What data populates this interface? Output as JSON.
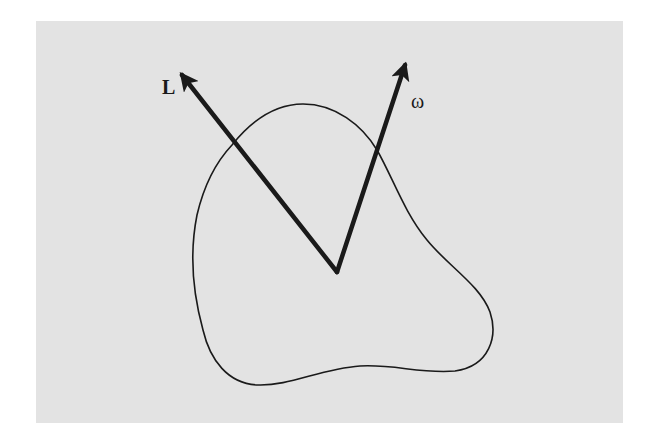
{
  "figure": {
    "background_color": "#e3e3e3",
    "ink_color": "#1a1a1a",
    "vectors": [
      {
        "id": "angular-momentum",
        "label": "L"
      },
      {
        "id": "angular-velocity",
        "label": "ω"
      }
    ],
    "body": {
      "name": "rigid body outline"
    }
  }
}
